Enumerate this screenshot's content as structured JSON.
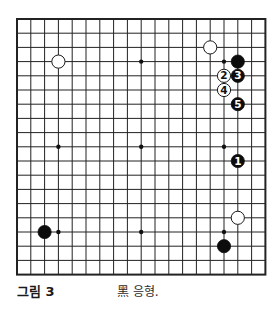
{
  "board": {
    "size": 19,
    "origin_x": 17,
    "origin_y": 19,
    "spacing_x": 13.8,
    "spacing_y": 14.2,
    "line_color": "#222222",
    "border_width": 2,
    "line_width": 1,
    "star_points": [
      [
        3,
        3
      ],
      [
        9,
        3
      ],
      [
        15,
        3
      ],
      [
        3,
        9
      ],
      [
        9,
        9
      ],
      [
        15,
        9
      ],
      [
        3,
        15
      ],
      [
        9,
        15
      ],
      [
        15,
        15
      ]
    ],
    "stones": [
      {
        "color": "white",
        "col": 3,
        "row": 3,
        "label": ""
      },
      {
        "color": "white",
        "col": 14,
        "row": 2,
        "label": ""
      },
      {
        "color": "black",
        "col": 16,
        "row": 3,
        "label": ""
      },
      {
        "color": "white",
        "col": 15,
        "row": 4,
        "label": "2"
      },
      {
        "color": "black",
        "col": 16,
        "row": 4,
        "label": "3"
      },
      {
        "color": "white",
        "col": 15,
        "row": 5,
        "label": "4"
      },
      {
        "color": "black",
        "col": 16,
        "row": 6,
        "label": "5"
      },
      {
        "color": "black",
        "col": 16,
        "row": 10,
        "label": "1"
      },
      {
        "color": "white",
        "col": 16,
        "row": 14,
        "label": ""
      },
      {
        "color": "black",
        "col": 15,
        "row": 16,
        "label": ""
      },
      {
        "color": "black",
        "col": 2,
        "row": 15,
        "label": ""
      }
    ]
  },
  "caption": {
    "figure_label": "그림 3",
    "text": "黑 응형."
  }
}
